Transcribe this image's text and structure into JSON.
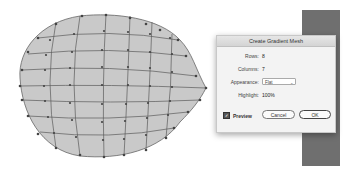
{
  "dialog": {
    "title": "Create Gradient Mesh",
    "rows_label": "Rows:",
    "rows_value": "8",
    "columns_label": "Columns:",
    "columns_value": "7",
    "appearance_label": "Appearance:",
    "appearance_value": "Flat",
    "highlight_label": "Highlight:",
    "highlight_value": "100%",
    "preview_label": "Preview",
    "preview_checked": true,
    "cancel_label": "Cancel",
    "ok_label": "OK"
  },
  "icons": {
    "check": "✓",
    "chevron": "⌄"
  },
  "colors": {
    "mesh_fill": "#c9c9c9",
    "mesh_line": "#555555",
    "bar": "#6f6f6f"
  }
}
